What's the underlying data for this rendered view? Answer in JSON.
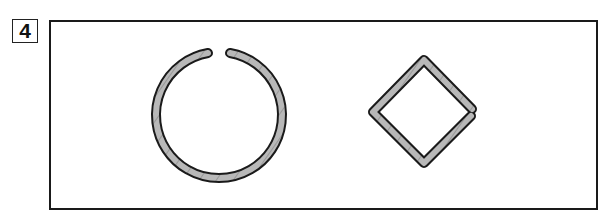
{
  "figure": {
    "label": "4",
    "shapes": [
      {
        "name": "open-ring",
        "type": "circle",
        "gap": "top"
      },
      {
        "name": "open-square",
        "type": "diamond",
        "gap": "right"
      }
    ],
    "colors": {
      "stroke": "#1a1a1a",
      "fill": "#b8b8b8",
      "hatch": "#6a6a6a",
      "background": "#ffffff"
    }
  }
}
